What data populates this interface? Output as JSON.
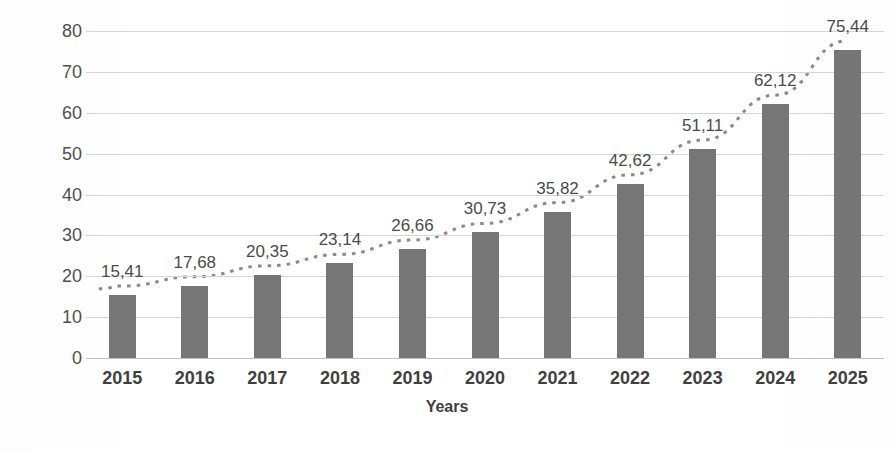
{
  "chart_data": {
    "type": "bar",
    "title": "",
    "xlabel": "Years",
    "ylabel": "Number of devices (billions)",
    "categories": [
      "2015",
      "2016",
      "2017",
      "2018",
      "2019",
      "2020",
      "2021",
      "2022",
      "2023",
      "2024",
      "2025"
    ],
    "values": [
      15.41,
      17.68,
      20.35,
      23.14,
      26.66,
      30.73,
      35.82,
      42.62,
      51.11,
      62.12,
      75.44
    ],
    "data_labels": [
      "15,41",
      "17,68",
      "20,35",
      "23,14",
      "26,66",
      "30,73",
      "35,82",
      "42,62",
      "51,11",
      "62,12",
      "75,44"
    ],
    "ylim": [
      0,
      80
    ],
    "ytick_values": [
      0,
      10,
      20,
      30,
      40,
      50,
      60,
      70,
      80
    ],
    "ytick_labels": [
      "0",
      "10",
      "20",
      "30",
      "40",
      "50",
      "60",
      "70",
      "80"
    ],
    "grid": true,
    "legend": false,
    "legend_position": "none",
    "decimal_separator": ",",
    "series": [
      {
        "name": "Number of devices",
        "values": [
          15.41,
          17.68,
          20.35,
          23.14,
          26.66,
          30.73,
          35.82,
          42.62,
          51.11,
          62.12,
          75.44
        ]
      }
    ],
    "trendline": {
      "present": true,
      "style": "dotted",
      "description": "dotted exponential trend overlay following the bar tops"
    },
    "colors": {
      "bar": "#767676",
      "gridline": "#d6d6d6",
      "baseline": "#c2c2c2",
      "text": "#4b4b4b",
      "axis_title": "#3f3f3f",
      "trendline": "#8a8a8a",
      "background": "#ffffff"
    }
  }
}
